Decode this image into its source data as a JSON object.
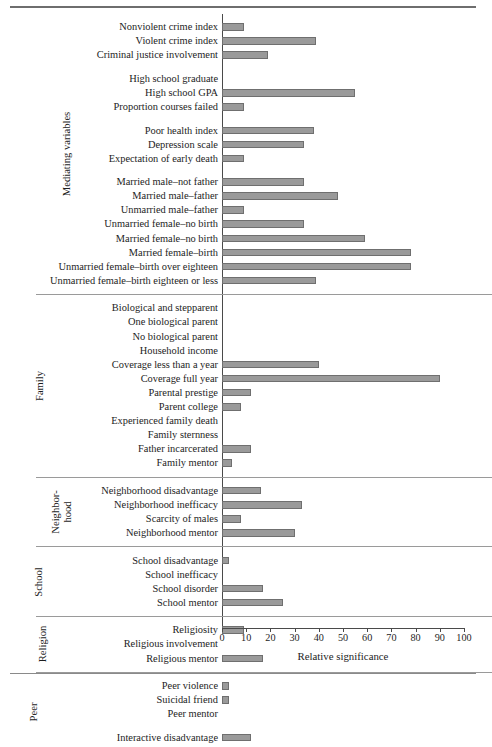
{
  "chart_data": {
    "type": "bar",
    "orientation": "horizontal",
    "title": "",
    "xlabel": "Relative significance",
    "ylabel": "",
    "xlim": [
      0,
      100
    ],
    "xticks": [
      0,
      10,
      20,
      30,
      40,
      50,
      60,
      70,
      80,
      90,
      100
    ],
    "grid": false,
    "legend": null,
    "bar_color": "#9a9a9a",
    "bar_edge_color": "#6f6f6f",
    "groups": [
      {
        "name": "Mediating variables",
        "label_lines": [
          "Mediating variables"
        ],
        "subgroups": [
          {
            "categories": [
              "Nonviolent crime index",
              "Violent crime index",
              "Criminal justice involvement"
            ],
            "values": [
              9,
              39,
              19
            ]
          },
          {
            "categories": [
              "High school graduate",
              "High school GPA",
              "Proportion courses failed"
            ],
            "values": [
              0,
              55,
              9
            ]
          },
          {
            "categories": [
              "Poor health index",
              "Depression scale",
              "Expectation of early death"
            ],
            "values": [
              38,
              34,
              9
            ]
          },
          {
            "categories": [
              "Married male–not father",
              "Married male–father",
              "Unmarried male–father",
              "Unmarried female–no birth",
              "Married female–no birth",
              "Married female–birth",
              "Unmarried female–birth over eighteen",
              "Unmarried female–birth eighteen or less"
            ],
            "values": [
              34,
              48,
              9,
              34,
              59,
              78,
              78,
              39
            ]
          }
        ]
      },
      {
        "name": "Family",
        "label_lines": [
          "Family"
        ],
        "subgroups": [
          {
            "categories": [
              "Biological and stepparent",
              "One biological parent",
              "No biological parent",
              "Household income",
              "Coverage less than a year",
              "Coverage full year",
              "Parental prestige",
              "Parent college",
              "Experienced family death",
              "Family sternness",
              "Father incarcerated",
              "Family mentor"
            ],
            "values": [
              0,
              0,
              0,
              0,
              40,
              90,
              12,
              8,
              0,
              0,
              12,
              4
            ]
          }
        ]
      },
      {
        "name": "Neighborhood",
        "label_lines": [
          "Neighbor-",
          "hood"
        ],
        "subgroups": [
          {
            "categories": [
              "Neighborhood disadvantage",
              "Neighborhood inefficacy",
              "Scarcity of males",
              "Neighborhood mentor"
            ],
            "values": [
              16,
              33,
              8,
              30
            ]
          }
        ]
      },
      {
        "name": "School",
        "label_lines": [
          "School"
        ],
        "subgroups": [
          {
            "categories": [
              "School disadvantage",
              "School inefficacy",
              "School disorder",
              "School mentor"
            ],
            "values": [
              3,
              0,
              17,
              25
            ]
          }
        ]
      },
      {
        "name": "Religion",
        "label_lines": [
          "Religion"
        ],
        "subgroups": [
          {
            "categories": [
              "Religiosity",
              "Religious involvement",
              "Religious mentor"
            ],
            "values": [
              9,
              0,
              17
            ]
          }
        ]
      },
      {
        "name": "Peer",
        "label_lines": [
          "Peer"
        ],
        "subgroups": [
          {
            "categories": [
              "Peer violence",
              "Suicidal friend",
              "Peer mentor"
            ],
            "values": [
              3,
              3,
              0
            ]
          },
          {
            "categories": [
              "Interactive disadvantage"
            ],
            "values": [
              12
            ]
          }
        ]
      }
    ]
  }
}
